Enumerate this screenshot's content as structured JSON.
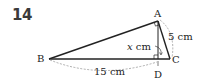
{
  "problem": {
    "number": "14"
  },
  "diagram": {
    "points": {
      "A": {
        "label": "A",
        "x": 158,
        "y": 21
      },
      "B": {
        "label": "B",
        "x": 49,
        "y": 59
      },
      "C": {
        "label": "C",
        "x": 170,
        "y": 59
      },
      "D": {
        "label": "D",
        "x": 158,
        "y": 59
      }
    },
    "labels": {
      "ac_length": "5 cm",
      "ad_length": "x cm",
      "ad_var": "x",
      "ad_unit": " cm",
      "bc_length": "15 cm"
    },
    "colors": {
      "line": "#222222",
      "dashed": "#999999"
    }
  }
}
